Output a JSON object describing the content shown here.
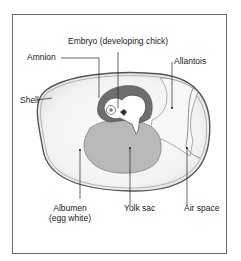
{
  "diagram": {
    "labels": {
      "embryo": "Embryo (developing chick)",
      "amnion": "Amnion",
      "allantois": "Allantois",
      "shell": "Shell",
      "albumen_line1": "Albumen",
      "albumen_line2": "(egg white)",
      "yolk_sac": "Yolk sac",
      "air_space": "Air space"
    },
    "colors": {
      "frame": "#6a6a6a",
      "shell_outline": "#555555",
      "albumen_fill": "#f2f2f2",
      "amnion_fill": "#6e6e6e",
      "yolk_fill": "#b9b9b9",
      "embryo_fill": "#ffffff",
      "leader_lines": "#222222"
    }
  }
}
